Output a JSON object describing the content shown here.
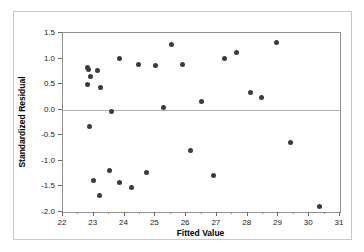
{
  "chart_data": {
    "type": "scatter",
    "title": "",
    "xlabel": "Fitted Value",
    "ylabel": "Standardized Residual",
    "xlim": [
      22,
      31
    ],
    "ylim": [
      -2.0,
      1.5
    ],
    "xticks": [
      22,
      23,
      24,
      25,
      26,
      27,
      28,
      29,
      30,
      31
    ],
    "xtick_labels": [
      "22",
      "23",
      "24",
      "25",
      "26",
      "27",
      "28",
      "29",
      "30",
      "31"
    ],
    "yticks": [
      1.5,
      1.0,
      0.5,
      0.0,
      -0.5,
      -1.0,
      -1.5,
      -2.0
    ],
    "ytick_labels": [
      "1.5",
      "1.0",
      "0.5",
      "0.0",
      "-0.5",
      "-1.0",
      "-1.5",
      "-2.0"
    ],
    "grid": false,
    "legend": null,
    "reference_line": {
      "axis": "y",
      "value": 0.0,
      "color": "#b0b0b0"
    },
    "marker": {
      "shape": "circle",
      "color": "#3b3b3b",
      "size": 5
    },
    "points": [
      {
        "x": 22.78,
        "y": 0.82
      },
      {
        "x": 22.82,
        "y": 0.78
      },
      {
        "x": 22.79,
        "y": 0.5
      },
      {
        "x": 22.88,
        "y": 0.65
      },
      {
        "x": 22.86,
        "y": -0.33
      },
      {
        "x": 23.0,
        "y": -1.39
      },
      {
        "x": 23.12,
        "y": 0.76
      },
      {
        "x": 23.17,
        "y": -1.67
      },
      {
        "x": 23.22,
        "y": 0.44
      },
      {
        "x": 23.5,
        "y": -1.19
      },
      {
        "x": 23.57,
        "y": -0.04
      },
      {
        "x": 23.85,
        "y": 1.01
      },
      {
        "x": 23.85,
        "y": -1.42
      },
      {
        "x": 24.22,
        "y": -1.52
      },
      {
        "x": 24.46,
        "y": 0.88
      },
      {
        "x": 24.72,
        "y": -1.22
      },
      {
        "x": 25.0,
        "y": 0.87
      },
      {
        "x": 25.28,
        "y": 0.04
      },
      {
        "x": 25.52,
        "y": 1.27
      },
      {
        "x": 25.88,
        "y": 0.89
      },
      {
        "x": 26.15,
        "y": -0.79
      },
      {
        "x": 26.5,
        "y": 0.17
      },
      {
        "x": 26.88,
        "y": -1.28
      },
      {
        "x": 27.25,
        "y": 1.01
      },
      {
        "x": 27.65,
        "y": 1.11
      },
      {
        "x": 28.08,
        "y": 0.34
      },
      {
        "x": 28.45,
        "y": 0.24
      },
      {
        "x": 28.95,
        "y": 1.32
      },
      {
        "x": 29.38,
        "y": -0.65
      },
      {
        "x": 30.32,
        "y": -1.89
      }
    ]
  },
  "figure": {
    "background": "#ffffff",
    "frame_color": "#8f8f8f",
    "outer_border_color": "#c9c9c9"
  }
}
